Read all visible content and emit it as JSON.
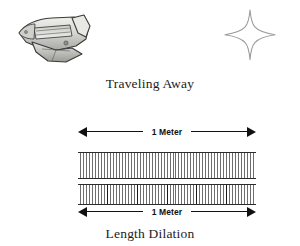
{
  "figure": {
    "top_panel": {
      "caption": "Traveling Away",
      "shuttle_icon_name": "space-shuttle-icon",
      "star_icon_name": "four-point-star-icon"
    },
    "bottom_panel": {
      "caption": "Length Dilation",
      "top_measure_label": "1 Meter",
      "bottom_measure_label": "1 Meter",
      "rulers": [
        {
          "name": "observer-ruler",
          "tick_count": 60,
          "major_every": 0
        },
        {
          "name": "moving-ruler",
          "tick_count": 60,
          "major_every": 10
        }
      ]
    }
  },
  "colors": {
    "background": "#ffffff",
    "ink": "#1c1c1c",
    "arrow": "#111111",
    "tick_minor": "#6e6e6e",
    "tick_major": "#1a1a1a",
    "shuttle_body": "#d9d9d6",
    "shuttle_outline": "#3a3a3a",
    "star_stroke": "#9a9a9a"
  }
}
